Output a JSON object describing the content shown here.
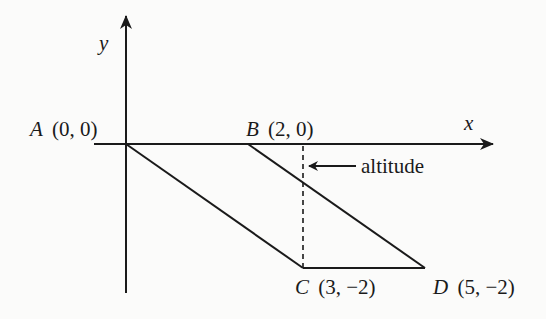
{
  "diagram": {
    "type": "coordinate-geometry",
    "axes": {
      "x_label": "x",
      "y_label": "y"
    },
    "points": {
      "A": {
        "name": "A",
        "coords": "(0, 0)"
      },
      "B": {
        "name": "B",
        "coords": "(2, 0)"
      },
      "C": {
        "name": "C",
        "coords": "(3, −2)"
      },
      "D": {
        "name": "D",
        "coords": "(5, −2)"
      }
    },
    "annotation": {
      "altitude_label": "altitude"
    },
    "colors": {
      "stroke": "#1a1a1a",
      "background": "#fbfbfa"
    }
  }
}
